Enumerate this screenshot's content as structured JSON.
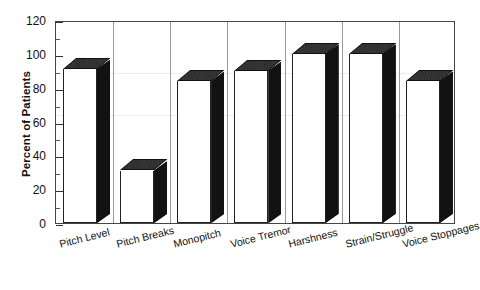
{
  "chart_data": {
    "type": "bar",
    "title": "",
    "subtitle": "",
    "xlabel": "",
    "ylabel": "Percent of Patients",
    "ylim": [
      0,
      120
    ],
    "ytick_step": 20,
    "yticks": [
      0,
      20,
      40,
      60,
      80,
      100,
      120
    ],
    "ytick_labels": [
      "0",
      "20",
      "40",
      "60",
      "80",
      "100",
      "120"
    ],
    "minor_ticks": true,
    "grid": false,
    "legend": null,
    "style": "3d-bar",
    "bar_face_color": "#ffffff",
    "bar_shade_color": "#1a1a1a",
    "axis_color": "#333333",
    "categories": [
      "Pitch Level",
      "Pitch Breaks",
      "Monopitch",
      "Voice Tremor",
      "Harshness",
      "Strain/Struggle",
      "Voice Stoppages"
    ],
    "values": [
      91,
      31,
      84,
      90,
      100,
      100,
      84
    ],
    "series": [
      {
        "name": "Percent of Patients",
        "values": [
          91,
          31,
          84,
          90,
          100,
          100,
          84
        ]
      }
    ]
  },
  "axes": {
    "y_title": "Percent of Patients"
  }
}
